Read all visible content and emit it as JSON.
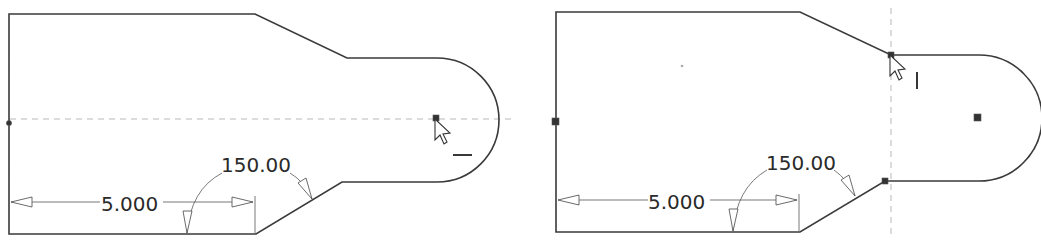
{
  "panels": [
    {
      "id": "left",
      "linear_dimension": "5.000",
      "angular_dimension": "150.00",
      "inference_line": "horizontal",
      "constraint_glyph": "horizontal-constraint-icon",
      "snap_point": "arc-center"
    },
    {
      "id": "right",
      "linear_dimension": "5.000",
      "angular_dimension": "150.00",
      "inference_line": "vertical",
      "constraint_glyph": "vertical-constraint-icon",
      "snap_point": "chamfer-endpoint"
    }
  ],
  "colors": {
    "geometry": "#3a3a3a",
    "dimension": "#6a6a6a",
    "inference": "#b8b8b8",
    "background": "#ffffff"
  }
}
